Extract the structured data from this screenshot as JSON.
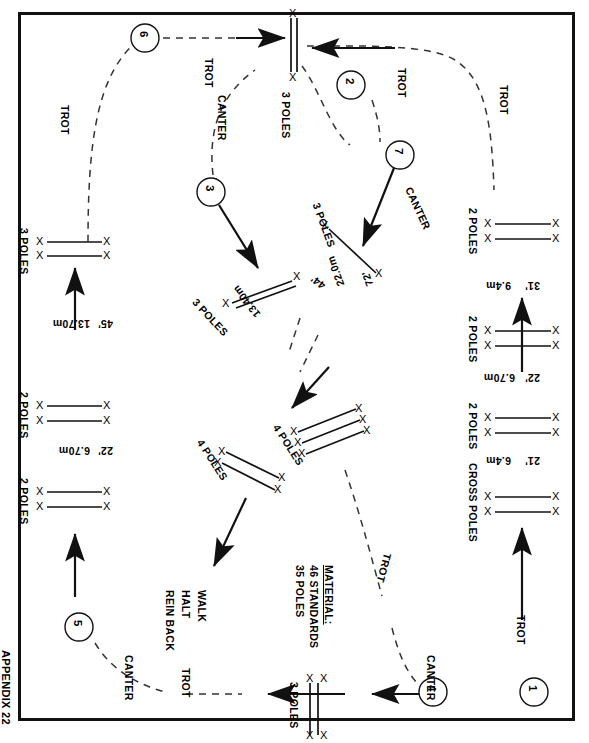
{
  "page": {
    "appendix_label": "APPENDIX 22",
    "orientation_note": "plan rotated 90 degrees"
  },
  "material": {
    "heading": "MATERIAL:",
    "lines": [
      "46 STANDARDS",
      "35 POLES"
    ]
  },
  "gaits": {
    "trot": "TROT",
    "canter": "CANTER",
    "walk": "WALK",
    "halt": "HALT",
    "rein_back": "REIN BACK"
  },
  "markers": [
    {
      "id": "1",
      "label": "1"
    },
    {
      "id": "2",
      "label": "2"
    },
    {
      "id": "3",
      "label": "3"
    },
    {
      "id": "4",
      "label": "4"
    },
    {
      "id": "5",
      "label": "5"
    },
    {
      "id": "6",
      "label": "6"
    },
    {
      "id": "7",
      "label": "7"
    }
  ],
  "jumps": [
    {
      "name": "right-line-2-poles-top",
      "label": "2 POLES"
    },
    {
      "name": "right-line-2-poles-mid",
      "label": "2 POLES"
    },
    {
      "name": "right-line-2-poles-low",
      "label": "2 POLES"
    },
    {
      "name": "right-line-cross-poles",
      "label": "CROSS POLES"
    },
    {
      "name": "left-line-3-poles",
      "label": "3 POLES"
    },
    {
      "name": "left-line-2-poles-upper",
      "label": "2 POLES"
    },
    {
      "name": "left-line-2-poles-lower",
      "label": "2 POLES"
    },
    {
      "name": "top-vertical-3-poles",
      "label": "3 POLES"
    },
    {
      "name": "bottom-vertical-3-poles",
      "label": "3 POLES"
    },
    {
      "name": "diagonal-3-poles-13-40",
      "label": "3 POLES"
    },
    {
      "name": "diagonal-3-poles-22-0",
      "label": "3 POLES"
    },
    {
      "name": "centre-4-poles-left",
      "label": "4 POLES"
    },
    {
      "name": "centre-4-poles-right",
      "label": "4 POLES"
    }
  ],
  "distances": [
    {
      "name": "right-31",
      "imperial": "31'",
      "metric": "9.4m"
    },
    {
      "name": "right-22",
      "imperial": "22'",
      "metric": "6.70m"
    },
    {
      "name": "right-21",
      "imperial": "21'",
      "metric": "6.4m"
    },
    {
      "name": "left-45",
      "imperial": "45'",
      "metric": "13.70m"
    },
    {
      "name": "left-22",
      "imperial": "22'",
      "metric": "6.70m"
    },
    {
      "name": "diag-44",
      "imperial": "44'",
      "metric": "13.40m"
    },
    {
      "name": "diag-72",
      "imperial": "72'",
      "metric": "22.0m"
    }
  ],
  "pole_end_glyph": "X",
  "colors": {
    "ink": "#111111",
    "paper": "#ffffff",
    "path": "#333333"
  }
}
